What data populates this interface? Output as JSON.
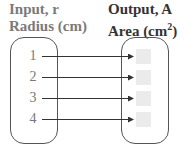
{
  "headers": {
    "input_line1": "Input, r",
    "input_line2": "Radius (cm)",
    "output_line1": "Output, A",
    "output_line2_base": "Area (cm",
    "output_line2_sup": "2",
    "output_line2_end": ")"
  },
  "inputs": [
    "1",
    "2",
    "3",
    "4"
  ],
  "outputs": [
    "",
    "",
    "",
    ""
  ],
  "colors": {
    "input_header": "#7a7a7a",
    "output_header": "#333333",
    "output_box": "#ebebeb",
    "line": "#333333"
  }
}
